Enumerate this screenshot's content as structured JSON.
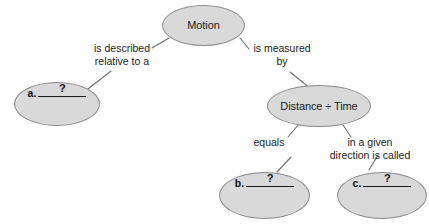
{
  "diagram": {
    "background_color": "#ffffff",
    "node_fill_color": "#d9d9d9",
    "node_stroke_color": "#8a8a8a",
    "text_color": "#1b1b1b",
    "nodes": [
      {
        "id": "motion",
        "label": "Motion",
        "kind": "concept"
      },
      {
        "id": "answer_a",
        "letter": "a.",
        "blank": "?",
        "kind": "blank"
      },
      {
        "id": "distance_time",
        "label": "Distance ÷ Time",
        "kind": "concept"
      },
      {
        "id": "answer_b",
        "letter": "b.",
        "blank": "?",
        "kind": "blank"
      },
      {
        "id": "answer_c",
        "letter": "c.",
        "blank": "?",
        "kind": "blank"
      }
    ],
    "edge_labels": [
      {
        "id": "edge_described",
        "text": "is described\nrelative to a",
        "from": "motion",
        "to": "answer_a"
      },
      {
        "id": "edge_measured",
        "text": "is measured\nby",
        "from": "motion",
        "to": "distance_time"
      },
      {
        "id": "edge_equals",
        "text": "equals",
        "from": "distance_time",
        "to": "answer_b"
      },
      {
        "id": "edge_direction",
        "text": "in a given\ndirection is called",
        "from": "distance_time",
        "to": "answer_c"
      }
    ]
  }
}
